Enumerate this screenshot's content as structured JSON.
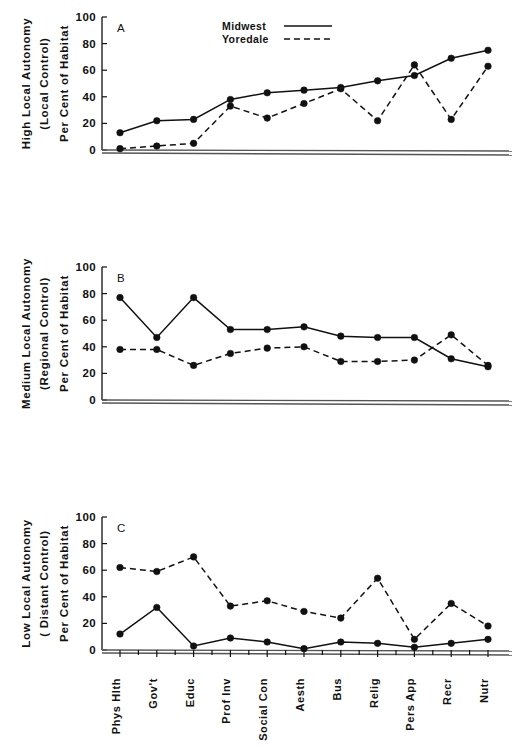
{
  "figure": {
    "legend": {
      "midwest_label": "Midwest",
      "yoredale_label": "Yoredale",
      "midwest_style": "solid",
      "yoredale_style": "dashed"
    },
    "categories": [
      "Phys Hlth",
      "Gov't",
      "Educ",
      "Prof Inv",
      "Social Con",
      "Aesth",
      "Bus",
      "Relig",
      "Pers App",
      "Recr",
      "Nutr"
    ],
    "y_ticks": [
      "0",
      "20",
      "40",
      "60",
      "80",
      "100"
    ],
    "line_color": "#111111"
  },
  "panels": {
    "a": {
      "letter": "A",
      "title_line1": "High Local Autonomy",
      "title_line2": "(Local Control)",
      "value_axis_title": "Per Cent of Habitat"
    },
    "b": {
      "letter": "B",
      "title_line1": "Medium Local Autonomy",
      "title_line2": "(Regional Control)",
      "value_axis_title": "Per Cent of Habitat"
    },
    "c": {
      "letter": "C",
      "title_line1": "Low Local Autonomy",
      "title_line2": "( Distant Control)",
      "value_axis_title": "Per Cent of Habitat"
    }
  },
  "chart_data": [
    {
      "type": "line",
      "panel": "A",
      "title": "High Local Autonomy (Local Control)",
      "xlabel": "",
      "ylabel": "Per Cent of Habitat",
      "ylim": [
        0,
        100
      ],
      "yticks": [
        0,
        20,
        40,
        60,
        80,
        100
      ],
      "grid": false,
      "legend_position": "top-center",
      "categories": [
        "Phys Hlth",
        "Gov't",
        "Educ",
        "Prof Inv",
        "Social Con",
        "Aesth",
        "Bus",
        "Relig",
        "Pers App",
        "Recr",
        "Nutr"
      ],
      "series": [
        {
          "name": "Midwest",
          "style": "solid",
          "values": [
            13,
            22,
            23,
            38,
            43,
            45,
            47,
            52,
            56,
            69,
            75
          ]
        },
        {
          "name": "Yoredale",
          "style": "dashed",
          "values": [
            1,
            3,
            5,
            33,
            24,
            35,
            46,
            22,
            64,
            23,
            63
          ]
        }
      ]
    },
    {
      "type": "line",
      "panel": "B",
      "title": "Medium Local Autonomy (Regional Control)",
      "xlabel": "",
      "ylabel": "Per Cent of Habitat",
      "ylim": [
        0,
        100
      ],
      "yticks": [
        0,
        20,
        40,
        60,
        80,
        100
      ],
      "grid": false,
      "legend_position": "none",
      "categories": [
        "Phys Hlth",
        "Gov't",
        "Educ",
        "Prof Inv",
        "Social Con",
        "Aesth",
        "Bus",
        "Relig",
        "Pers App",
        "Recr",
        "Nutr"
      ],
      "series": [
        {
          "name": "Midwest",
          "style": "solid",
          "values": [
            77,
            47,
            77,
            53,
            53,
            55,
            48,
            47,
            47,
            31,
            25
          ]
        },
        {
          "name": "Yoredale",
          "style": "dashed",
          "values": [
            38,
            38,
            26,
            35,
            39,
            40,
            29,
            29,
            30,
            49,
            26
          ]
        }
      ]
    },
    {
      "type": "line",
      "panel": "C",
      "title": "Low Local Autonomy (Distant Control)",
      "xlabel": "",
      "ylabel": "Per Cent of Habitat",
      "ylim": [
        0,
        100
      ],
      "yticks": [
        0,
        20,
        40,
        60,
        80,
        100
      ],
      "grid": false,
      "legend_position": "none",
      "categories": [
        "Phys Hlth",
        "Gov't",
        "Educ",
        "Prof Inv",
        "Social Con",
        "Aesth",
        "Bus",
        "Relig",
        "Pers App",
        "Recr",
        "Nutr"
      ],
      "series": [
        {
          "name": "Midwest",
          "style": "solid",
          "values": [
            12,
            32,
            3,
            9,
            6,
            1,
            6,
            5,
            2,
            5,
            8
          ]
        },
        {
          "name": "Yoredale",
          "style": "dashed",
          "values": [
            62,
            59,
            70,
            33,
            37,
            29,
            24,
            54,
            8,
            35,
            18
          ]
        }
      ]
    }
  ]
}
